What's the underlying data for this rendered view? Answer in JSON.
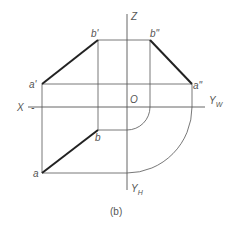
{
  "diagram": {
    "caption": "(b)",
    "labels": {
      "z_axis": "Z",
      "x_axis": "X",
      "yw_axis": "Y",
      "yw_sub": "W",
      "yh_axis": "Y",
      "yh_sub": "H",
      "origin": "O",
      "a_prime": "a'",
      "b_prime": "b'",
      "b_double_prime": "b\"",
      "a_double_prime": "a\"",
      "a": "a",
      "b": "b"
    },
    "colors": {
      "line": "#555555",
      "bold": "#222222"
    }
  }
}
